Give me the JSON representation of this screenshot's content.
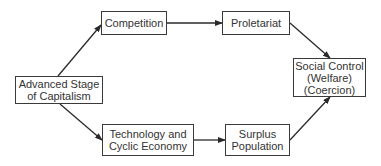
{
  "diagram": {
    "type": "flowchart",
    "nodes": {
      "advanced": {
        "lines": [
          "Advanced Stage",
          "of Capitalism"
        ]
      },
      "competition": {
        "lines": [
          "Competition"
        ]
      },
      "proletariat": {
        "lines": [
          "Proletariat"
        ]
      },
      "technology": {
        "lines": [
          "Technology and",
          "Cyclic Economy"
        ]
      },
      "surplus": {
        "lines": [
          "Surplus",
          "Population"
        ]
      },
      "social_control": {
        "lines": [
          "Social Control",
          "(Welfare)",
          "(Coercion)"
        ]
      }
    },
    "edges": [
      {
        "from": "Advanced Stage of Capitalism",
        "to": "Competition"
      },
      {
        "from": "Competition",
        "to": "Proletariat"
      },
      {
        "from": "Proletariat",
        "to": "Social Control (Welfare) (Coercion)"
      },
      {
        "from": "Advanced Stage of Capitalism",
        "to": "Technology and Cyclic Economy"
      },
      {
        "from": "Technology and Cyclic Economy",
        "to": "Surplus Population"
      },
      {
        "from": "Surplus Population",
        "to": "Social Control (Welfare) (Coercion)"
      }
    ],
    "colors": {
      "line": "#2a2a2a",
      "box_border": "#3a3a3a",
      "text": "#333333",
      "background": "#ffffff"
    }
  }
}
